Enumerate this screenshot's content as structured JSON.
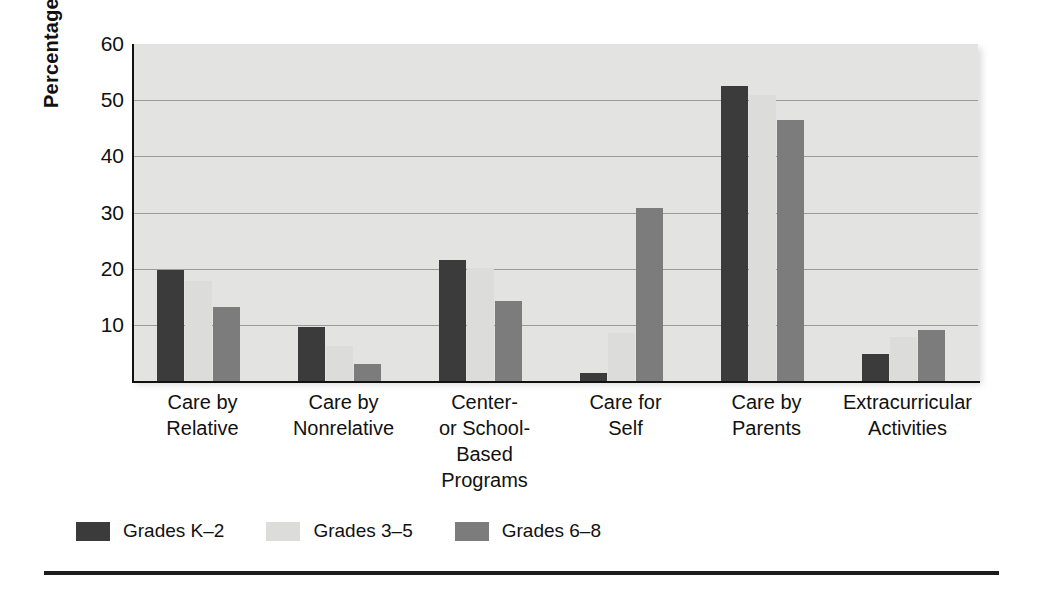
{
  "chart_data": {
    "type": "bar",
    "title": "",
    "xlabel": "",
    "ylabel": "Percentage",
    "ylim": [
      0,
      60
    ],
    "yticks": [
      10,
      20,
      30,
      40,
      50,
      60
    ],
    "ytick_labels": [
      "10",
      "20",
      "30",
      "40",
      "50",
      "60"
    ],
    "grid": true,
    "legend_position": "bottom-left",
    "categories": [
      "Care by Relative",
      "Care by Nonrelative",
      "Center- or School-Based Programs",
      "Care for Self",
      "Care by Parents",
      "Extracurricular Activities"
    ],
    "category_lines": [
      [
        "Care by",
        "Relative"
      ],
      [
        "Care by",
        "Nonrelative"
      ],
      [
        "Center-",
        "or School-",
        "Based",
        "Programs"
      ],
      [
        "Care for",
        "Self"
      ],
      [
        "Care by",
        "Parents"
      ],
      [
        "Extracurricular",
        "Activities"
      ]
    ],
    "series": [
      {
        "name": "Grades K–2",
        "color": "#3b3b3b",
        "values": [
          19.8,
          9.6,
          21.5,
          1.4,
          52.5,
          4.8
        ]
      },
      {
        "name": "Grades 3–5",
        "color": "#dcdcda",
        "values": [
          17.8,
          6.3,
          20.1,
          8.5,
          51.0,
          7.9
        ]
      },
      {
        "name": "Grades 6–8",
        "color": "#7c7c7c",
        "values": [
          13.2,
          3.1,
          14.3,
          30.8,
          46.5,
          9.0
        ]
      }
    ]
  },
  "legend": {
    "items": [
      {
        "label": "Grades K–2"
      },
      {
        "label": "Grades 3–5"
      },
      {
        "label": "Grades 6–8"
      }
    ]
  },
  "axis": {
    "y_title": "Percentage"
  },
  "colors": {
    "series_k2": "#3b3b3b",
    "series_35": "#dcdcda",
    "series_68": "#7c7c7c",
    "plot_background": "#e3e3e1",
    "gridline": "#9a9a98",
    "axis": "#111111"
  }
}
